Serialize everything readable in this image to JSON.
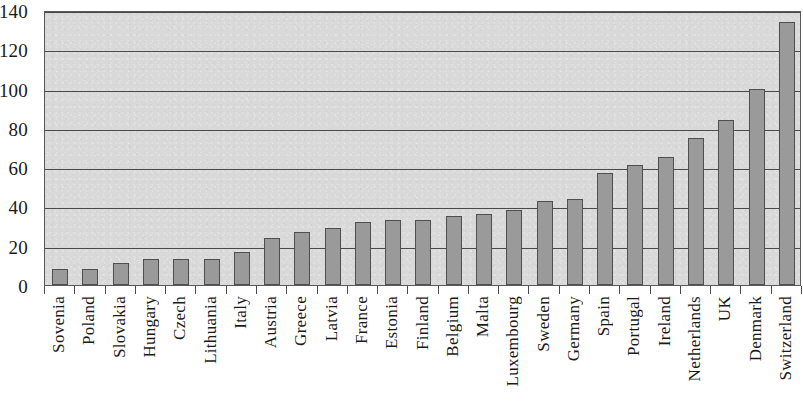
{
  "chart_data": {
    "type": "bar",
    "title": "",
    "subtitle": "",
    "xlabel": "",
    "ylabel": "",
    "ylim": [
      0,
      140
    ],
    "yticks": [
      0,
      20,
      40,
      60,
      80,
      100,
      120,
      140
    ],
    "grid": true,
    "legend": false,
    "legend_position": "none",
    "categories": [
      "Sovenia",
      "Poland",
      "Slovakia",
      "Hungary",
      "Czech",
      "Lithuania",
      "Italy",
      "Austria",
      "Greece",
      "Latvia",
      "France",
      "Estonia",
      "Finland",
      "Belgium",
      "Malta",
      "Luxembourg",
      "Sweden",
      "Germany",
      "Spain",
      "Portugal",
      "Ireland",
      "Netherlands",
      "UK",
      "Denmark",
      "Switzerland"
    ],
    "values": [
      8,
      8,
      11,
      13,
      13,
      13,
      17,
      24,
      27,
      29,
      32,
      33,
      33,
      35,
      36,
      38,
      43,
      44,
      57,
      61,
      65,
      75,
      84,
      100,
      134
    ],
    "colors": {
      "bar_fill": "#9a9a9a",
      "bar_border": "#4f4f4f",
      "plot_background": "#d9d9d9",
      "gridline": "#4a4a4a",
      "axis": "#4a4a4a",
      "text": "#1a1a1a"
    }
  }
}
